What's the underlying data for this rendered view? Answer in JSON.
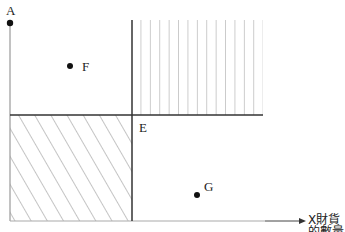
{
  "diagram": {
    "y_axis_label": "A",
    "x_axis_label": "X財貨的數量",
    "points": [
      {
        "label": "A",
        "x": 10,
        "y": 23
      },
      {
        "label": "F",
        "x": 70,
        "y": 66
      },
      {
        "label": "E",
        "x": 132,
        "y": 115
      },
      {
        "label": "G",
        "x": 197,
        "y": 195
      }
    ],
    "regions": [
      {
        "name": "upper-right",
        "pattern": "vertical-lines"
      },
      {
        "name": "lower-left",
        "pattern": "diagonal-lines"
      }
    ],
    "colors": {
      "axis": "#999999",
      "divider": "#333333",
      "hatch": "#999999",
      "text": "#222222"
    }
  }
}
